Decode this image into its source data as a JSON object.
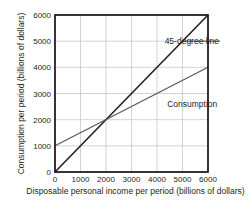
{
  "chart_data": {
    "type": "line",
    "title": "",
    "xlabel": "Disposable personal income per period (billions of dollars)",
    "ylabel": "Consumption per period (billions of dollars)",
    "xlim": [
      0,
      6000
    ],
    "ylim": [
      0,
      6000
    ],
    "xticks": [
      0,
      1000,
      2000,
      3000,
      4000,
      5000,
      6000
    ],
    "yticks": [
      0,
      1000,
      2000,
      3000,
      4000,
      5000,
      6000
    ],
    "grid": true,
    "legend": "none (inline annotations)",
    "series": [
      {
        "name": "45-degree line",
        "x": [
          0,
          6000
        ],
        "y": [
          0,
          6000
        ],
        "color": "#231f20",
        "width": 1.6
      },
      {
        "name": "Consumption",
        "x": [
          0,
          6000
        ],
        "y": [
          1000,
          4000
        ],
        "color": "#58595b",
        "width": 1.2
      }
    ],
    "annotations": [
      {
        "text": "45-degree line",
        "x": 4300,
        "y": 5000,
        "leader_to_x": 5000
      },
      {
        "text": "Consumption",
        "x": 4400,
        "y": 2600
      }
    ]
  },
  "colors": {
    "axis": "#231f20",
    "grid": "#c8c8c8",
    "background": "#ffffff"
  }
}
